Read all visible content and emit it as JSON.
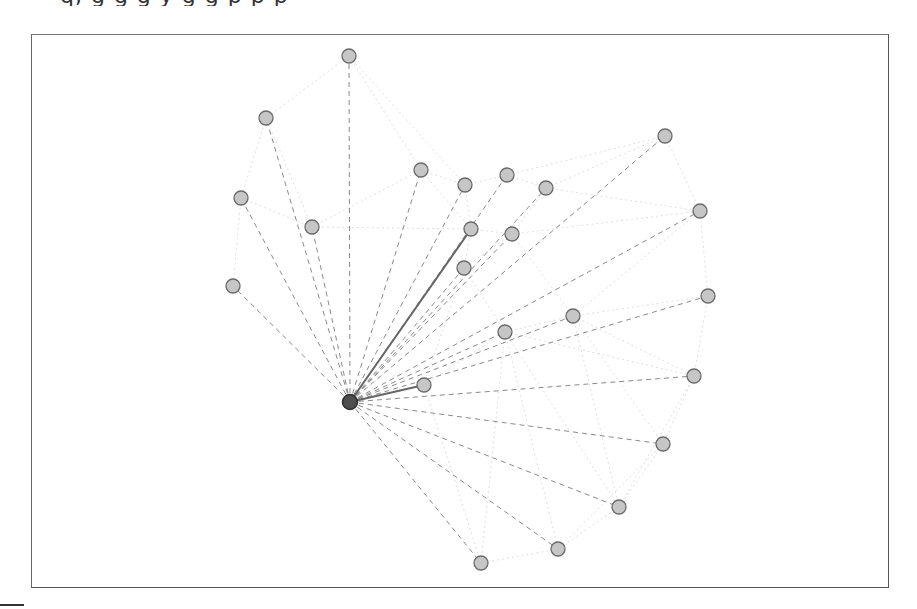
{
  "caption": {
    "text": "q, g g g y g g p p p"
  },
  "colors": {
    "frame": "#555555",
    "node_fill": "#c6c6c6",
    "node_stroke": "#6a6a6a",
    "center_fill": "#4e4e4e",
    "edge_dashed": "#8a8a8a",
    "edge_solid": "#666666",
    "edge_faint": "#d6d6d6"
  },
  "graph": {
    "center": {
      "id": "c",
      "x": 350,
      "y": 402
    },
    "nodes": [
      {
        "id": "n1",
        "x": 349,
        "y": 56
      },
      {
        "id": "n2",
        "x": 266,
        "y": 118
      },
      {
        "id": "n3",
        "x": 241,
        "y": 198
      },
      {
        "id": "n4",
        "x": 312,
        "y": 227
      },
      {
        "id": "n5",
        "x": 233,
        "y": 286
      },
      {
        "id": "n6",
        "x": 421,
        "y": 170
      },
      {
        "id": "n7",
        "x": 465,
        "y": 185
      },
      {
        "id": "n8",
        "x": 507,
        "y": 175
      },
      {
        "id": "n9",
        "x": 546,
        "y": 188
      },
      {
        "id": "n10",
        "x": 665,
        "y": 136
      },
      {
        "id": "n11",
        "x": 471,
        "y": 229
      },
      {
        "id": "n12",
        "x": 512,
        "y": 234
      },
      {
        "id": "n13",
        "x": 464,
        "y": 268
      },
      {
        "id": "n14",
        "x": 700,
        "y": 211
      },
      {
        "id": "n15",
        "x": 708,
        "y": 296
      },
      {
        "id": "n16",
        "x": 505,
        "y": 332
      },
      {
        "id": "n17",
        "x": 573,
        "y": 316
      },
      {
        "id": "n18",
        "x": 424,
        "y": 385
      },
      {
        "id": "n19",
        "x": 694,
        "y": 376
      },
      {
        "id": "n20",
        "x": 663,
        "y": 444
      },
      {
        "id": "n21",
        "x": 619,
        "y": 507
      },
      {
        "id": "n22",
        "x": 558,
        "y": 549
      },
      {
        "id": "n23",
        "x": 481,
        "y": 563
      }
    ],
    "solid_edges": [
      "n11",
      "n18"
    ],
    "faint_edges": [
      [
        "n1",
        "n2"
      ],
      [
        "n1",
        "n6"
      ],
      [
        "n1",
        "n7"
      ],
      [
        "n2",
        "n3"
      ],
      [
        "n2",
        "n4"
      ],
      [
        "n3",
        "n4"
      ],
      [
        "n3",
        "n5"
      ],
      [
        "n4",
        "n6"
      ],
      [
        "n4",
        "n11"
      ],
      [
        "n6",
        "n7"
      ],
      [
        "n7",
        "n8"
      ],
      [
        "n8",
        "n9"
      ],
      [
        "n9",
        "n10"
      ],
      [
        "n8",
        "n10"
      ],
      [
        "n10",
        "n14"
      ],
      [
        "n11",
        "n12"
      ],
      [
        "n12",
        "n13"
      ],
      [
        "n11",
        "n13"
      ],
      [
        "n12",
        "n9"
      ],
      [
        "n12",
        "n17"
      ],
      [
        "n14",
        "n15"
      ],
      [
        "n14",
        "n17"
      ],
      [
        "n15",
        "n19"
      ],
      [
        "n15",
        "n17"
      ],
      [
        "n16",
        "n17"
      ],
      [
        "n13",
        "n16"
      ],
      [
        "n16",
        "n18"
      ],
      [
        "n16",
        "n19"
      ],
      [
        "n17",
        "n19"
      ],
      [
        "n19",
        "n20"
      ],
      [
        "n20",
        "n21"
      ],
      [
        "n21",
        "n22"
      ],
      [
        "n22",
        "n23"
      ],
      [
        "n16",
        "n23"
      ],
      [
        "n16",
        "n22"
      ],
      [
        "n17",
        "n20"
      ],
      [
        "n20",
        "n22"
      ],
      [
        "n16",
        "n21"
      ],
      [
        "n18",
        "n23"
      ],
      [
        "n12",
        "n14"
      ],
      [
        "n9",
        "n14"
      ],
      [
        "n7",
        "n11"
      ],
      [
        "n6",
        "n11"
      ],
      [
        "n13",
        "n18"
      ],
      [
        "n17",
        "n21"
      ],
      [
        "n19",
        "n21"
      ]
    ]
  }
}
